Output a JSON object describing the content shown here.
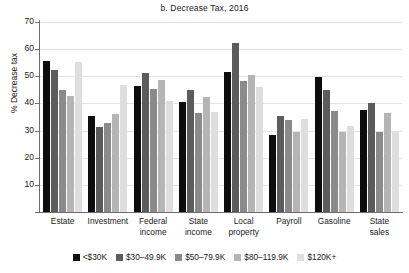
{
  "chart_data": {
    "type": "bar",
    "title": "b. Decrease Tax, 2016",
    "xlabel": "",
    "ylabel": "% Decrease tax",
    "ylim": [
      0,
      70
    ],
    "ytick_step": 10,
    "yticks": [
      0,
      10,
      20,
      30,
      40,
      50,
      60,
      70
    ],
    "ytick_labels": [
      "",
      "10",
      "20",
      "30",
      "40",
      "50",
      "60",
      "70"
    ],
    "grid": true,
    "legend_position": "bottom",
    "categories": [
      "Estate",
      "Investment",
      "Federal income",
      "State income",
      "Local property",
      "Payroll",
      "Gasoline",
      "State sales"
    ],
    "category_lines": [
      [
        "Estate"
      ],
      [
        "Investment"
      ],
      [
        "Federal",
        "income"
      ],
      [
        "State",
        "income"
      ],
      [
        "Local",
        "property"
      ],
      [
        "Payroll"
      ],
      [
        "Gasoline"
      ],
      [
        "State",
        "sales"
      ]
    ],
    "series": [
      {
        "name": "<$30K",
        "color": "#0d0d0d",
        "values": [
          55.8,
          35.3,
          46.5,
          40.5,
          51.6,
          28.5,
          49.8,
          37.7
        ]
      },
      {
        "name": "$30–49.9K",
        "color": "#5c5c5c",
        "values": [
          52.3,
          31.4,
          51.3,
          44.8,
          62.3,
          35.4,
          45.0,
          40.3
        ]
      },
      {
        "name": "$50–79.9K",
        "color": "#8a8a8a",
        "values": [
          44.9,
          32.8,
          45.4,
          36.3,
          48.3,
          34.0,
          37.2,
          29.5
        ]
      },
      {
        "name": "$80–119.9K",
        "color": "#b5b5b5",
        "values": [
          42.7,
          36.0,
          48.6,
          42.5,
          50.4,
          29.5,
          29.5,
          36.6
        ]
      },
      {
        "name": "$120K+",
        "color": "#dedede",
        "values": [
          55.4,
          46.8,
          41.0,
          37.0,
          46.2,
          34.4,
          31.8,
          29.5
        ]
      }
    ]
  }
}
